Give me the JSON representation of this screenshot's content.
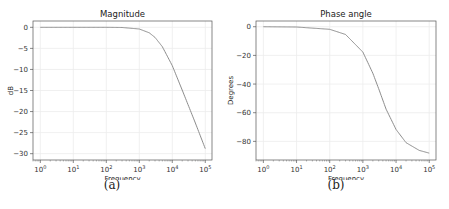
{
  "chart_data": [
    {
      "type": "line",
      "title": "Magnitude",
      "xlabel": "Frequency",
      "ylabel": "dB",
      "xscale": "log",
      "xlim": [
        0.6,
        160000
      ],
      "ylim": [
        -31.5,
        1.5
      ],
      "grid": true,
      "x_tick_labels": [
        "10^0",
        "10^1",
        "10^2",
        "10^3",
        "10^4",
        "10^5"
      ],
      "y_ticks": [
        0,
        -5,
        -10,
        -15,
        -20,
        -25,
        -30
      ],
      "series": [
        {
          "name": "magnitude",
          "color": "#8c8c8c",
          "x": [
            1,
            10,
            100,
            300,
            1000,
            2000,
            3000,
            5000,
            10000,
            20000,
            50000,
            100000
          ],
          "y": [
            0,
            0,
            0,
            -0.04,
            -0.4,
            -1.3,
            -2.4,
            -4.6,
            -9.1,
            -14.9,
            -22.7,
            -28.8
          ]
        }
      ],
      "caption": "(a)"
    },
    {
      "type": "line",
      "title": "Phase angle",
      "xlabel": "Frequency",
      "ylabel": "Degrees",
      "xscale": "log",
      "xlim": [
        0.6,
        160000
      ],
      "ylim": [
        -93,
        4
      ],
      "grid": true,
      "x_tick_labels": [
        "10^0",
        "10^1",
        "10^2",
        "10^3",
        "10^4",
        "10^5"
      ],
      "y_ticks": [
        0,
        -20,
        -40,
        -60,
        -80
      ],
      "series": [
        {
          "name": "phase",
          "color": "#8c8c8c",
          "x": [
            1,
            10,
            100,
            300,
            1000,
            2000,
            3000,
            5000,
            10000,
            20000,
            50000,
            100000
          ],
          "y": [
            0,
            -0.2,
            -1.8,
            -5.4,
            -17.7,
            -32.5,
            -43.3,
            -57.5,
            -71.7,
            -80.9,
            -86.3,
            -88.2
          ]
        }
      ],
      "caption": "(b)"
    }
  ]
}
